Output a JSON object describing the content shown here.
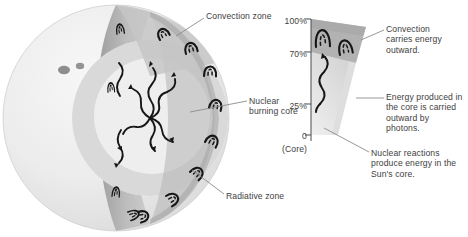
{
  "figure": {
    "background_color": "#ffffff",
    "text_color": "#3e3e3e"
  },
  "left_diagram": {
    "name": "sun-cutaway-sphere",
    "labels": [
      {
        "id": "convection_zone",
        "text": "Convection zone"
      },
      {
        "id": "nuclear_burning_core",
        "text": "Nuclear\nburning core"
      },
      {
        "id": "radiative_zone",
        "text": "Radiative zone"
      }
    ],
    "features": {
      "sunspots": 2,
      "convection_cells_rim": 8,
      "photon_arrows": 6
    },
    "colors": {
      "sphere_surface": "#ededed",
      "sphere_shadow": "#e0e0e0",
      "cut_face": "#b8b8b8",
      "convection_band": "#a8a8a8",
      "radiative_interior": "#d8d8d8",
      "core": "#f2f2f2",
      "line": "#1a1a1a",
      "sunspot": "#8f8f8f"
    }
  },
  "right_diagram": {
    "name": "sun-interior-wedge",
    "axis": {
      "title": "",
      "ticks": [
        {
          "value": "100%",
          "fraction": 1.0
        },
        {
          "value": "70%",
          "fraction": 0.7
        },
        {
          "value": "25%",
          "fraction": 0.25
        },
        {
          "value": "0",
          "fraction": 0.0
        }
      ],
      "base_label": "(Core)"
    },
    "annotations": [
      {
        "id": "convection_note",
        "text": "Convection\ncarries energy\noutward."
      },
      {
        "id": "photon_note",
        "text": "Energy produced in\nthe core is carried\noutward by\nphotons."
      },
      {
        "id": "core_note",
        "text": "Nuclear reactions\nproduce energy in the\nSun's core."
      }
    ],
    "zones": [
      {
        "id": "convection_zone",
        "from": 0.7,
        "to": 1.0,
        "color": "#b0b0b0"
      },
      {
        "id": "radiative_zone",
        "from": 0.0,
        "to": 0.7,
        "color": "#dcdcdc"
      }
    ],
    "features": {
      "convection_cells": 2,
      "photon_arrows": 1
    }
  }
}
